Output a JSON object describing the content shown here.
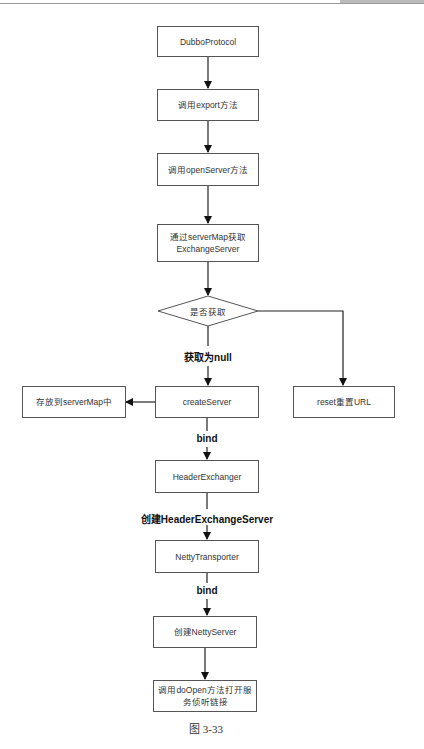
{
  "diagram": {
    "nodes": {
      "dubbo_protocol": "DubboProtocol",
      "call_export": "调用export方法",
      "call_open_server": "调用openServer方法",
      "get_exchange_server": "通过serverMap获取ExchangeServer",
      "get_exchange_server_line1": "通过serverMap获取",
      "get_exchange_server_line2": "ExchangeServer",
      "decision": "是否获取",
      "create_server": "createServer",
      "store_server_map": "存放到serverMap中",
      "reset_url": "reset重置URL",
      "header_exchanger": "HeaderExchanger",
      "netty_transporter": "NettyTransporter",
      "create_netty_server": "创建NettyServer",
      "do_open": "调用doOpen方法打开服务侦听链接",
      "do_open_line1": "调用doOpen方法打开服",
      "do_open_line2": "务侦听链接"
    },
    "edge_labels": {
      "null_result": "获取为null",
      "bind_1": "bind",
      "create_header_exchange_server": "创建HeaderExchangeServer",
      "bind_2": "bind"
    },
    "caption": "图 3-33"
  }
}
